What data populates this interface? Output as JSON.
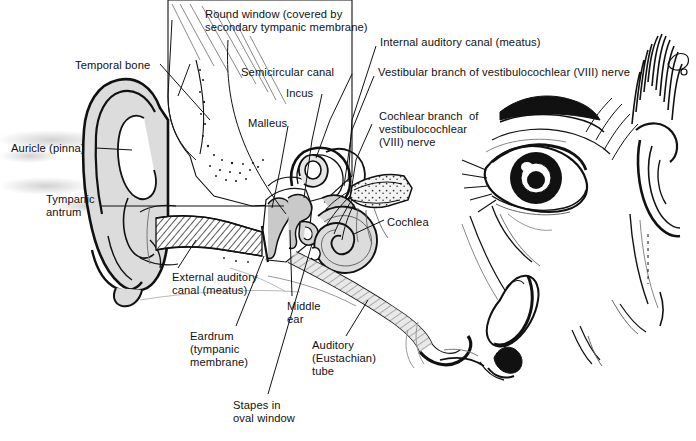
{
  "figure": {
    "type": "anatomical-line-diagram",
    "background_color": "#ffffff",
    "ink_color": "#111111",
    "fill_gray": "#d8d8d8",
    "mid_gray": "#b0b0b0"
  },
  "labels": [
    {
      "id": "round-window",
      "text": "Round window (covered by\nsecondary tympanic membrane)",
      "x": 205,
      "y": 8,
      "align": "left"
    },
    {
      "id": "temporal-bone",
      "text": "Temporal bone",
      "x": 75,
      "y": 59,
      "align": "left"
    },
    {
      "id": "internal-auditory-canal",
      "text": "Internal auditory canal (meatus)",
      "x": 380,
      "y": 36,
      "align": "left"
    },
    {
      "id": "semicircular-canal",
      "text": "Semicircular canal",
      "x": 241,
      "y": 66,
      "align": "left"
    },
    {
      "id": "vestibular-branch",
      "text": "Vestibular branch of vestibulocochlear (VIII) nerve",
      "x": 378,
      "y": 66,
      "align": "left"
    },
    {
      "id": "incus",
      "text": "Incus",
      "x": 286,
      "y": 87,
      "align": "left"
    },
    {
      "id": "cochlear-branch",
      "text": "Cochlear branch  of\nvestibulocochlear\n(VIII) nerve",
      "x": 379,
      "y": 110,
      "align": "left"
    },
    {
      "id": "malleus",
      "text": "Malleus",
      "x": 248,
      "y": 117,
      "align": "left"
    },
    {
      "id": "auricle-pinna",
      "text": "Auricle (pinna)",
      "x": 11,
      "y": 142,
      "align": "left"
    },
    {
      "id": "tympanic-antrum",
      "text": "Tympanic\nantrum",
      "x": 46,
      "y": 193,
      "align": "left"
    },
    {
      "id": "cochlea",
      "text": "Cochlea",
      "x": 387,
      "y": 216,
      "align": "left"
    },
    {
      "id": "external-auditory-canal",
      "text": "External auditory\ncanal (meatus)",
      "x": 172,
      "y": 271,
      "align": "left"
    },
    {
      "id": "middle-ear",
      "text": "Middle\near",
      "x": 287,
      "y": 300,
      "align": "left"
    },
    {
      "id": "eardrum",
      "text": "Eardrum\n(tympanic\nmembrane)",
      "x": 190,
      "y": 330,
      "align": "left"
    },
    {
      "id": "auditory-tube",
      "text": "Auditory\n(Eustachian)\ntube",
      "x": 312,
      "y": 339,
      "align": "left"
    },
    {
      "id": "stapes-oval-window",
      "text": "Stapes in\noval window",
      "x": 233,
      "y": 399,
      "align": "left"
    }
  ],
  "structures": [
    {
      "id": "pinna",
      "name": "Auricle (pinna)"
    },
    {
      "id": "external-canal",
      "name": "External auditory canal (meatus)"
    },
    {
      "id": "eardrum",
      "name": "Eardrum (tympanic membrane)"
    },
    {
      "id": "malleus",
      "name": "Malleus"
    },
    {
      "id": "incus",
      "name": "Incus"
    },
    {
      "id": "stapes",
      "name": "Stapes in oval window"
    },
    {
      "id": "semicircular-canals",
      "name": "Semicircular canal"
    },
    {
      "id": "cochlea",
      "name": "Cochlea"
    },
    {
      "id": "round-window",
      "name": "Round window"
    },
    {
      "id": "vestibulocochlear-nerve",
      "name": "Vestibulocochlear (VIII) nerve"
    },
    {
      "id": "eustachian-tube",
      "name": "Auditory (Eustachian) tube"
    },
    {
      "id": "temporal-bone",
      "name": "Temporal bone"
    },
    {
      "id": "tympanic-antrum",
      "name": "Tympanic antrum"
    },
    {
      "id": "face-profile",
      "name": "Facial profile with eye, eyebrow and nose"
    }
  ]
}
